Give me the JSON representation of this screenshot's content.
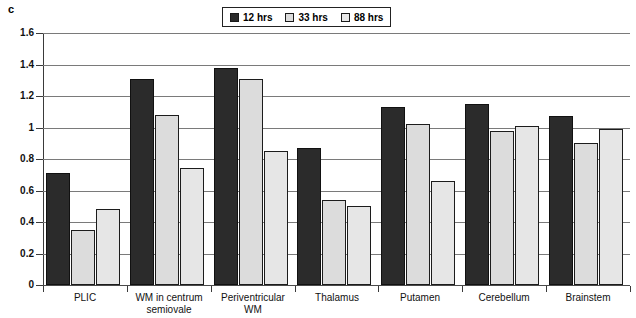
{
  "panel": {
    "label": "c"
  },
  "legend": {
    "position": "top-center",
    "items": [
      {
        "label": "12 hrs",
        "color": "#2b2b2b"
      },
      {
        "label": "33 hrs",
        "color": "#dcdcdc"
      },
      {
        "label": "88 hrs",
        "color": "#e8e8e8"
      }
    ]
  },
  "chart_data": {
    "type": "bar",
    "title": "",
    "xlabel": "",
    "ylabel": "",
    "ylim": [
      0,
      1.6
    ],
    "grid": true,
    "legend_position": "top-center",
    "ytick_labels": [
      "0",
      "0.2",
      "0.4",
      "0.6",
      "0.8",
      "1",
      "1.2",
      "1.4",
      "1.6"
    ],
    "ytick_values": [
      0,
      0.2,
      0.4,
      0.6,
      0.8,
      1.0,
      1.2,
      1.4,
      1.6
    ],
    "categories": [
      "PLIC",
      "WM in centrum semiovale",
      "Periventricular WM",
      "Thalamus",
      "Putamen",
      "Cerebellum",
      "Brainstem"
    ],
    "series": [
      {
        "name": "12 hrs",
        "color": "#2b2b2b",
        "values": [
          0.71,
          1.31,
          1.38,
          0.87,
          1.13,
          1.15,
          1.07
        ]
      },
      {
        "name": "33 hrs",
        "color": "#dcdcdc",
        "values": [
          0.35,
          1.08,
          1.31,
          0.54,
          1.02,
          0.98,
          0.9
        ]
      },
      {
        "name": "88 hrs",
        "color": "#e6e6e6",
        "values": [
          0.48,
          0.74,
          0.85,
          0.5,
          0.66,
          1.01,
          0.99
        ]
      }
    ]
  }
}
